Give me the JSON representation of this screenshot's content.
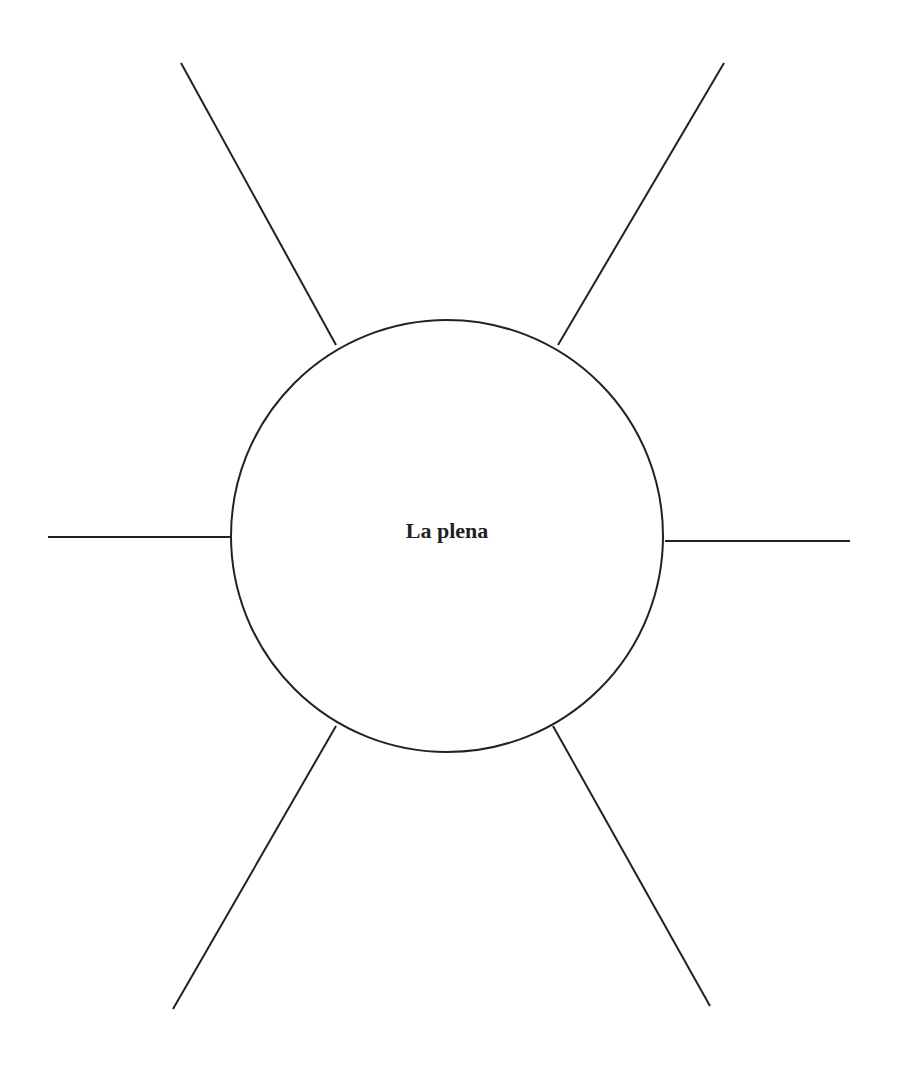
{
  "diagram": {
    "type": "spider-map",
    "center": {
      "label": "La plena",
      "cx": 447,
      "cy": 536,
      "r": 216
    },
    "spokes": [
      {
        "position": "top-left",
        "label": "",
        "x1": 181,
        "y1": 63,
        "x2": 336,
        "y2": 345
      },
      {
        "position": "top-right",
        "label": "",
        "x1": 724,
        "y1": 63,
        "x2": 558,
        "y2": 345
      },
      {
        "position": "left",
        "label": "",
        "x1": 48,
        "y1": 537,
        "x2": 231,
        "y2": 537
      },
      {
        "position": "right",
        "label": "",
        "x1": 665,
        "y1": 541,
        "x2": 850,
        "y2": 541
      },
      {
        "position": "bottom-left",
        "label": "",
        "x1": 173,
        "y1": 1009,
        "x2": 336,
        "y2": 726
      },
      {
        "position": "bottom-right",
        "label": "",
        "x1": 710,
        "y1": 1006,
        "x2": 553,
        "y2": 726
      }
    ],
    "colors": {
      "stroke": "#222222",
      "background": "#ffffff",
      "text": "#222222"
    }
  }
}
